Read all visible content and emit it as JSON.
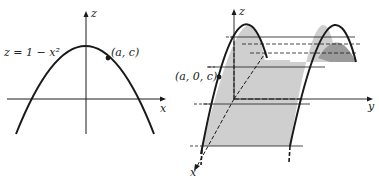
{
  "left_panel": {
    "equation": "z = 1 − x²",
    "point_label": "(a, c)",
    "axis_x": "x",
    "axis_z": "z"
  },
  "right_panel": {
    "point_label": "(a, 0, c)",
    "axis_x": "x",
    "axis_y": "y",
    "axis_z": "z"
  },
  "colors": {
    "ink": "#1a1a1a",
    "surface_fill": "#cfcfcf",
    "surface_shade": "#9a9a9a",
    "background": "#ffffff"
  }
}
